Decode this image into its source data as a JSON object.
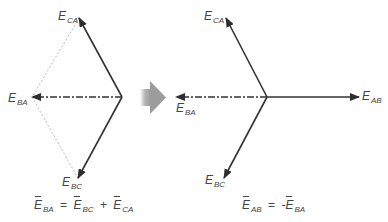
{
  "colors": {
    "vector_line": "#333333",
    "construction_line": "#9a9a9a",
    "transition_arrow": "#9c9c9c",
    "text": "#444444"
  },
  "left_diagram": {
    "labels": {
      "E_CA": {
        "main": "E",
        "sub": "CA"
      },
      "E_BA": {
        "main": "E",
        "sub": "BA"
      },
      "E_BC": {
        "main": "E",
        "sub": "BC"
      }
    },
    "equation": {
      "lhs": {
        "main": "E",
        "sub": "BA"
      },
      "eq": "=",
      "t1": {
        "main": "E",
        "sub": "BC"
      },
      "plus": "+",
      "t2": {
        "main": "E",
        "sub": "CA"
      }
    }
  },
  "transition_icon": "right-arrow-icon",
  "right_diagram": {
    "labels": {
      "E_CA": {
        "main": "E",
        "sub": "CA"
      },
      "E_BA": {
        "main": "E",
        "sub": "BA"
      },
      "E_BC": {
        "main": "E",
        "sub": "BC"
      },
      "E_AB": {
        "main": "E",
        "sub": "AB"
      }
    },
    "equation": {
      "lhs": {
        "main": "E",
        "sub": "AB"
      },
      "eq": "=",
      "neg": "-",
      "rhs": {
        "main": "E",
        "sub": "BA"
      }
    }
  }
}
